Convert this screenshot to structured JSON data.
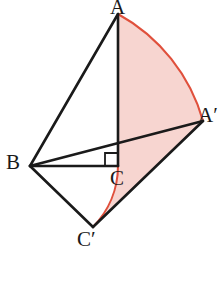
{
  "figure": {
    "canvas": {
      "width": 222,
      "height": 297
    },
    "colors": {
      "stroke": "#1a1a1a",
      "arc_stroke": "#e0503c",
      "sector_fill": "#f7d5d0",
      "label_color": "#1a1a1a",
      "background": "#ffffff"
    },
    "labels": {
      "A": "A",
      "A_prime": "Aʹ",
      "B": "B",
      "C": "C",
      "C_prime": "Cʹ"
    },
    "points": {
      "A": {
        "x": 118,
        "y": 14
      },
      "A_prime": {
        "x": 203,
        "y": 121
      },
      "B": {
        "x": 30,
        "y": 166
      },
      "C": {
        "x": 118,
        "y": 166
      },
      "C_prime": {
        "x": 93,
        "y": 227
      }
    },
    "right_angle": {
      "at": "C",
      "marker_size": 13,
      "note": "right angle between BC and AC at vertex C"
    },
    "segments": [
      {
        "name": "A-B",
        "from": "A",
        "to": "B"
      },
      {
        "name": "A-C",
        "from": "A",
        "to": "C"
      },
      {
        "name": "B-C",
        "from": "B",
        "to": "C"
      },
      {
        "name": "B-A-prime",
        "from": "B",
        "to": "A_prime"
      },
      {
        "name": "B-C-prime",
        "from": "B",
        "to": "C_prime"
      },
      {
        "name": "C-prime-A-prime",
        "from": "C_prime",
        "to": "A_prime"
      }
    ],
    "arcs": [
      {
        "name": "arc-A-to-A-prime",
        "from": "A",
        "to": "A_prime",
        "center": "B",
        "radius": 177,
        "sweep": "clockwise"
      },
      {
        "name": "arc-C-to-C-prime",
        "from": "C",
        "to": "C_prime",
        "center": "B",
        "radius": 88,
        "sweep": "clockwise"
      }
    ],
    "shaded_region": {
      "name": "swept-sector",
      "description": "annular sector swept between arc A-A-prime and arc C-C-prime",
      "fill": "#f7d5d0"
    }
  }
}
